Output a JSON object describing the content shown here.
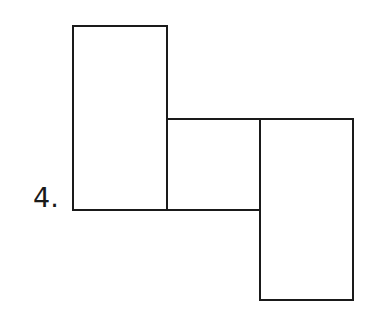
{
  "problem": {
    "number_label": "4."
  },
  "diagram": {
    "stroke_color": "#1a1a1a",
    "shapes": [
      {
        "name": "left-tall-rectangle",
        "x": 73,
        "y": 26,
        "w": 94,
        "h": 184
      },
      {
        "name": "middle-square",
        "x": 167,
        "y": 119,
        "w": 93,
        "h": 91
      },
      {
        "name": "right-tall-rectangle",
        "x": 260,
        "y": 119,
        "w": 93,
        "h": 181
      }
    ]
  }
}
